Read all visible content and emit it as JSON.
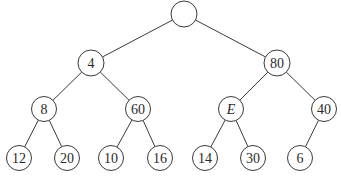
{
  "diagram": {
    "type": "binary-tree",
    "nodes": [
      {
        "id": "root",
        "label": "",
        "italic": false
      },
      {
        "id": "n4",
        "label": "4",
        "italic": false
      },
      {
        "id": "n80",
        "label": "80",
        "italic": false
      },
      {
        "id": "n8",
        "label": "8",
        "italic": false
      },
      {
        "id": "n60",
        "label": "60",
        "italic": false
      },
      {
        "id": "nE",
        "label": "E",
        "italic": true
      },
      {
        "id": "n40",
        "label": "40",
        "italic": false
      },
      {
        "id": "n12",
        "label": "12",
        "italic": false
      },
      {
        "id": "n20",
        "label": "20",
        "italic": false
      },
      {
        "id": "n10",
        "label": "10",
        "italic": false
      },
      {
        "id": "n16",
        "label": "16",
        "italic": false
      },
      {
        "id": "n14",
        "label": "14",
        "italic": false
      },
      {
        "id": "n30",
        "label": "30",
        "italic": false
      },
      {
        "id": "n6",
        "label": "6",
        "italic": false
      }
    ],
    "edges": [
      [
        "root",
        "n4"
      ],
      [
        "root",
        "n80"
      ],
      [
        "n4",
        "n8"
      ],
      [
        "n4",
        "n60"
      ],
      [
        "n80",
        "nE"
      ],
      [
        "n80",
        "n40"
      ],
      [
        "n8",
        "n12"
      ],
      [
        "n8",
        "n20"
      ],
      [
        "n60",
        "n10"
      ],
      [
        "n60",
        "n16"
      ],
      [
        "nE",
        "n14"
      ],
      [
        "nE",
        "n30"
      ],
      [
        "n40",
        "n6"
      ]
    ]
  }
}
